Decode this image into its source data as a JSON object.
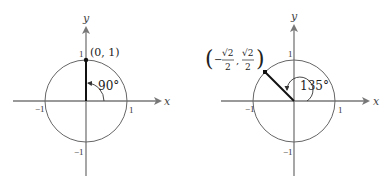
{
  "figures": [
    {
      "id": "left",
      "angle_label": "90°",
      "point_label": "(0, 1)",
      "x_axis_label": "x",
      "y_axis_label": "y",
      "ticks": {
        "x_pos": "1",
        "x_neg": "−1",
        "y_pos": "1",
        "y_neg": "−1"
      }
    },
    {
      "id": "right",
      "angle_label": "135°",
      "point_label_open": "(",
      "point_label_x_sign": "−",
      "point_label_x_num": "√2",
      "point_label_x_den": "2",
      "point_label_sep": ",",
      "point_label_y_num": "√2",
      "point_label_y_den": "2",
      "point_label_close": ")",
      "x_axis_label": "x",
      "y_axis_label": "y",
      "ticks": {
        "x_pos": "1",
        "x_neg": "−1",
        "y_pos": "1",
        "y_neg": "−1"
      }
    }
  ],
  "colors": {
    "axis": "#777777",
    "circle": "#666666",
    "radius": "#111111"
  }
}
